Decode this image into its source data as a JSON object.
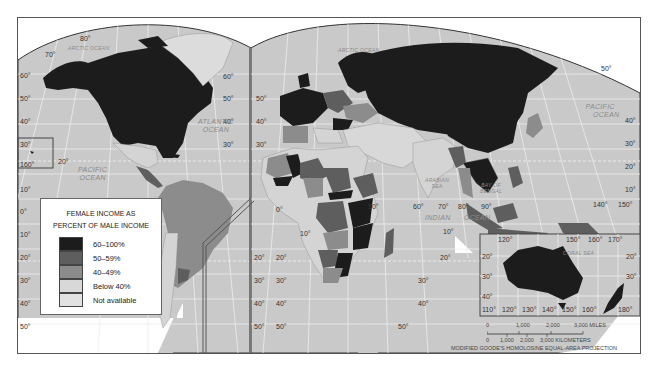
{
  "map": {
    "title": "Female income as percent of male income",
    "projection": "MODIFIED GOODE'S HOMOLOSINE EQUAL-AREA PROJECTION",
    "colors": {
      "c60_100": "#1c1c1c",
      "c50_59": "#5e5e5e",
      "c40_49": "#8c8c8c",
      "below40": "#d4d4d4",
      "not_available": "#dcdcdc",
      "ocean": "#c9c9c9",
      "grid": "#f2f2f2",
      "border": "#444444"
    }
  },
  "legend": {
    "title_line1": "FEMALE INCOME AS",
    "title_line2": "PERCENT OF MALE INCOME",
    "items": [
      {
        "label": "60–100%",
        "color": "#1c1c1c"
      },
      {
        "label": "50–59%",
        "color": "#5e5e5e"
      },
      {
        "label": "40–49%",
        "color": "#8c8c8c"
      },
      {
        "label": "Below 40%",
        "color": "#d8d8d8"
      },
      {
        "label": "Not available",
        "color": "#e2e2e2"
      }
    ]
  },
  "oceans": {
    "arctic_left": "ARCTIC OCEAN",
    "arctic_right": "ARCTIC OCEAN",
    "atlantic_1": "ATLANTIC",
    "atlantic_2": "OCEAN",
    "pacific_left_1": "PACIFIC",
    "pacific_left_2": "OCEAN",
    "pacific_right_1": "PACIFIC",
    "pacific_right_2": "OCEAN",
    "indian_1": "INDIAN",
    "indian_2": "OCEAN",
    "arabian_1": "ARABIAN",
    "arabian_2": "SEA",
    "bengal_1": "BAY OF",
    "bengal_2": "BENGAL",
    "coral": "CORAL SEA"
  },
  "graticule": {
    "left_lat": [
      "80°",
      "70°",
      "60°",
      "50°",
      "40°",
      "30°",
      "20°",
      "10°",
      "0°",
      "10°",
      "20°",
      "30°",
      "40°",
      "50°"
    ],
    "hawaii_lon": "160°",
    "hawaii_lat": "20°",
    "mid_left_lat": [
      "60°",
      "50°",
      "40°",
      "30°",
      "20°",
      "30°",
      "40°",
      "50°"
    ],
    "mid_right_lat": [
      "50°",
      "40°",
      "30°",
      "20°",
      "30°",
      "40°",
      "50°"
    ],
    "africa_lat": [
      "0°",
      "10°"
    ],
    "indian_lon": [
      "50°",
      "60°",
      "70°",
      "80°",
      "90°"
    ],
    "indian_lat": [
      "10°",
      "20°",
      "30°",
      "40°",
      "50°"
    ],
    "right_lat": [
      "50°",
      "40°",
      "30°",
      "20°",
      "10°"
    ],
    "right_lon": [
      "140°",
      "150°"
    ],
    "inset_top_lon": [
      "120°",
      "150°",
      "160°",
      "170°"
    ],
    "inset_bottom_lon": [
      "110°",
      "120°",
      "130°",
      "140°",
      "150°",
      "160°",
      "180°"
    ],
    "inset_lat": [
      "20°",
      "30°",
      "40°",
      "20°",
      "30°"
    ]
  },
  "scale": {
    "miles": [
      "0",
      "1,000",
      "2,000",
      "3,000 MILES"
    ],
    "kilometers": [
      "0",
      "1,000",
      "2,000",
      "3,000 KILOMETERS"
    ]
  }
}
